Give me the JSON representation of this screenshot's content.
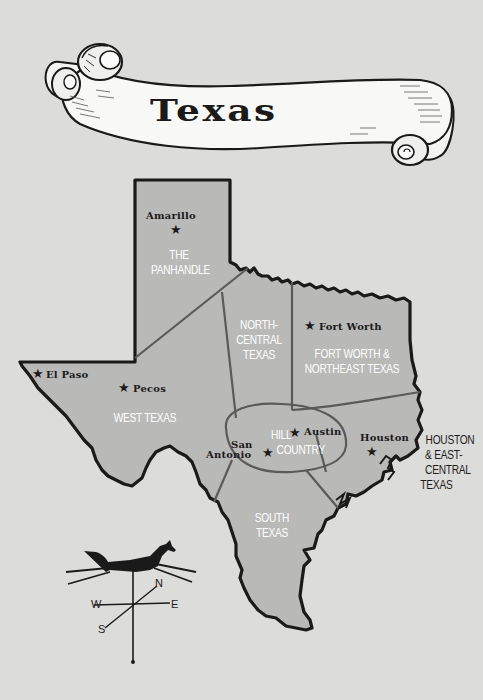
{
  "banner": {
    "title": "Texas"
  },
  "colors": {
    "background": "#dcdcda",
    "map_fill": "#b9b9b7",
    "outline": "#1a1a1a",
    "region_border": "#5a5a5a",
    "region_label": "#ffffff"
  },
  "regions": [
    {
      "id": "panhandle",
      "lines": [
        "THE",
        "PANHANDLE"
      ]
    },
    {
      "id": "north-central",
      "lines": [
        "NORTH-",
        "CENTRAL",
        "TEXAS"
      ]
    },
    {
      "id": "fort-worth-northeast",
      "lines": [
        "FORT WORTH &",
        "NORTHEAST TEXAS"
      ]
    },
    {
      "id": "west-texas",
      "lines": [
        "WEST TEXAS"
      ]
    },
    {
      "id": "hill-country",
      "lines": [
        "HILL",
        "COUNTRY"
      ]
    },
    {
      "id": "south-texas",
      "lines": [
        "SOUTH",
        "TEXAS"
      ]
    },
    {
      "id": "houston-east-central",
      "lines": [
        "HOUSTON",
        "& EAST-",
        "CENTRAL",
        "TEXAS"
      ]
    }
  ],
  "cities": [
    {
      "name": "Amarillo",
      "icon": "star-icon"
    },
    {
      "name": "Fort Worth",
      "icon": "star-icon"
    },
    {
      "name": "El Paso",
      "icon": "star-icon"
    },
    {
      "name": "Pecos",
      "icon": "star-icon"
    },
    {
      "name": "Austin",
      "icon": "star-icon"
    },
    {
      "name_line1": "San",
      "name_line2": "Antonio",
      "icon": "star-icon"
    },
    {
      "name": "Houston",
      "icon": "star-icon"
    }
  ],
  "star_glyph": "★",
  "compass": {
    "icon": "horse-weathervane-icon",
    "n": "N",
    "e": "E",
    "s": "S",
    "w": "W"
  }
}
